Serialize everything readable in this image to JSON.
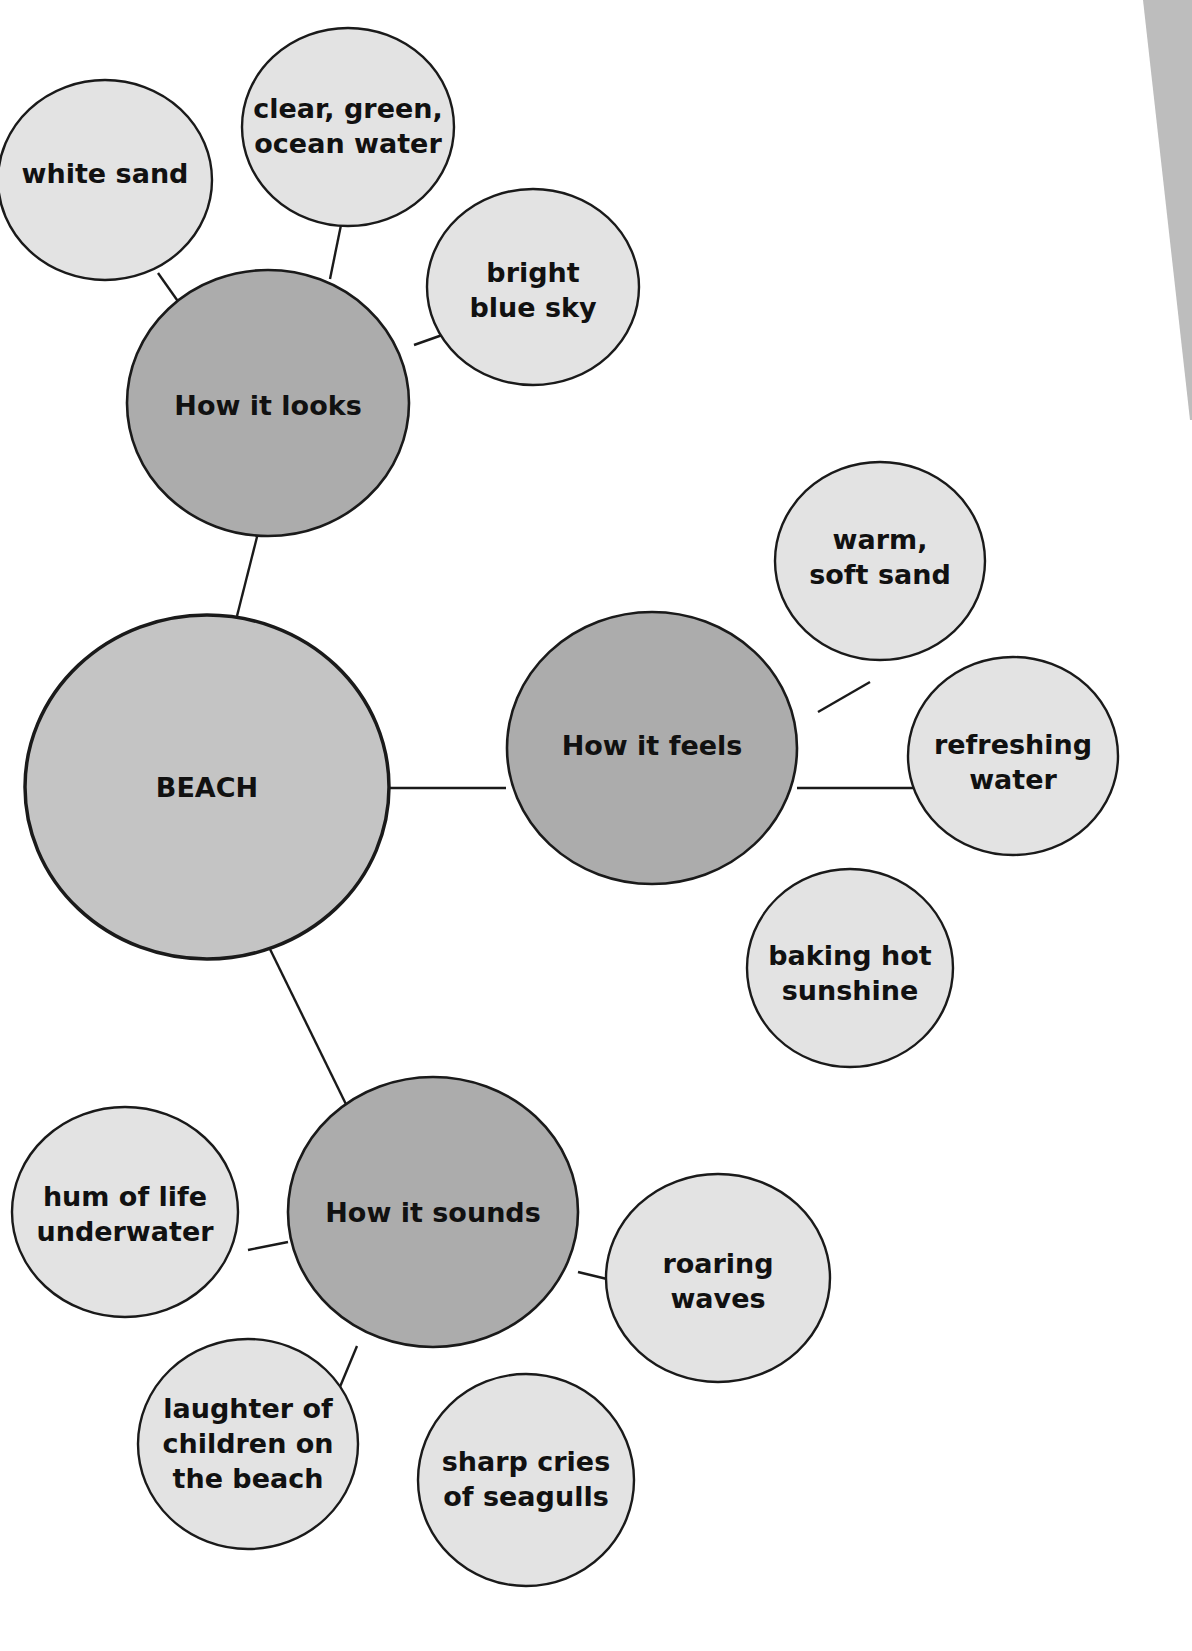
{
  "diagram": {
    "type": "bubble-map",
    "colors": {
      "background": "#ffffff",
      "center_fill": "#c4c4c4",
      "category_fill": "#acacac",
      "detail_fill": "#e3e3e3",
      "stroke": "#1a1a1a",
      "page_edge": "#bdbdbd"
    },
    "center": {
      "label": "BEACH"
    },
    "categories": [
      {
        "label": "How it looks",
        "details": [
          {
            "lines": [
              "white sand"
            ]
          },
          {
            "lines": [
              "clear, green,",
              "ocean water"
            ]
          },
          {
            "lines": [
              "bright",
              "blue sky"
            ]
          }
        ]
      },
      {
        "label": "How it feels",
        "details": [
          {
            "lines": [
              "warm,",
              "soft sand"
            ]
          },
          {
            "lines": [
              "refreshing",
              "water"
            ]
          },
          {
            "lines": [
              "baking hot",
              "sunshine"
            ]
          }
        ]
      },
      {
        "label": "How it sounds",
        "details": [
          {
            "lines": [
              "hum of life",
              "underwater"
            ]
          },
          {
            "lines": [
              "roaring",
              "waves"
            ]
          },
          {
            "lines": [
              "laughter of",
              "children on",
              "the beach"
            ]
          },
          {
            "lines": [
              "sharp cries",
              "of seagulls"
            ]
          }
        ]
      }
    ]
  }
}
